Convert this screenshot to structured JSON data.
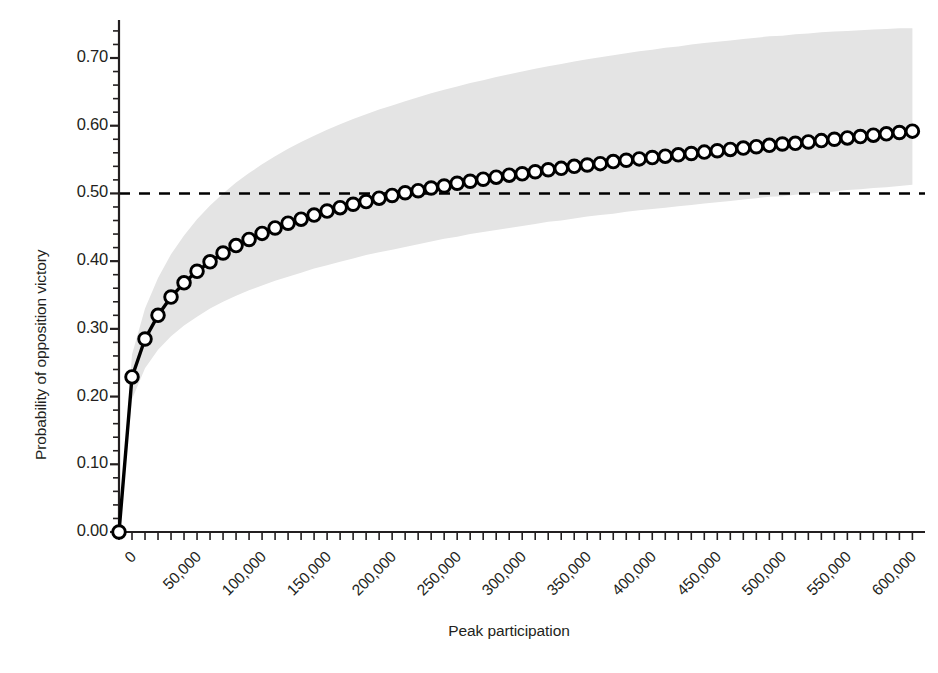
{
  "chart_data": {
    "type": "line",
    "title": "",
    "subtitle": "",
    "xlabel": "Peak participation",
    "ylabel": "Probability of opposition victory",
    "xlim": [
      0,
      612000
    ],
    "ylim": [
      0,
      0.745
    ],
    "grid": false,
    "legend_position": "none",
    "x_tick_labels": [
      "0",
      "50,000",
      "100,000",
      "150,000",
      "200,000",
      "250,000",
      "300,000",
      "350,000",
      "400,000",
      "450,000",
      "500,000",
      "550,000",
      "600,000"
    ],
    "x_tick_values": [
      0,
      50000,
      100000,
      150000,
      200000,
      250000,
      300000,
      350000,
      400000,
      450000,
      500000,
      550000,
      600000
    ],
    "x_minor_tick_step": 10000,
    "y_tick_labels": [
      "0.00",
      "0.10",
      "0.20",
      "0.30",
      "0.40",
      "0.50",
      "0.60",
      "0.70"
    ],
    "y_tick_values": [
      0.0,
      0.1,
      0.2,
      0.3,
      0.4,
      0.5,
      0.6,
      0.7
    ],
    "y_minor_tick_step": 0.02,
    "reference_line": {
      "y": 0.5,
      "style": "dashed",
      "color": "#000000",
      "label": ""
    },
    "marker": {
      "shape": "circle",
      "face_color": "#ffffff",
      "edge_color": "#000000",
      "size": 11
    },
    "line_color": "#000000",
    "band_color": "#e4e4e4",
    "band_label": "confidence interval",
    "x": [
      0,
      10000,
      20000,
      30000,
      40000,
      50000,
      60000,
      70000,
      80000,
      90000,
      100000,
      110000,
      120000,
      130000,
      140000,
      150000,
      160000,
      170000,
      180000,
      190000,
      200000,
      210000,
      220000,
      230000,
      240000,
      250000,
      260000,
      270000,
      280000,
      290000,
      300000,
      310000,
      320000,
      330000,
      340000,
      350000,
      360000,
      370000,
      380000,
      390000,
      400000,
      410000,
      420000,
      430000,
      440000,
      450000,
      460000,
      470000,
      480000,
      490000,
      500000,
      510000,
      520000,
      530000,
      540000,
      550000,
      560000,
      570000,
      580000,
      590000,
      600000,
      610000
    ],
    "y": [
      0.0,
      0.229,
      0.285,
      0.32,
      0.347,
      0.368,
      0.385,
      0.399,
      0.412,
      0.423,
      0.432,
      0.441,
      0.449,
      0.456,
      0.462,
      0.468,
      0.474,
      0.479,
      0.484,
      0.488,
      0.493,
      0.497,
      0.501,
      0.504,
      0.508,
      0.511,
      0.515,
      0.518,
      0.521,
      0.524,
      0.527,
      0.529,
      0.532,
      0.535,
      0.537,
      0.54,
      0.542,
      0.544,
      0.547,
      0.549,
      0.551,
      0.553,
      0.555,
      0.557,
      0.559,
      0.561,
      0.563,
      0.565,
      0.567,
      0.569,
      0.571,
      0.573,
      0.574,
      0.576,
      0.578,
      0.58,
      0.582,
      0.584,
      0.586,
      0.588,
      0.59,
      0.592
    ],
    "y_upper": [
      0.0,
      0.262,
      0.33,
      0.375,
      0.41,
      0.438,
      0.462,
      0.482,
      0.5,
      0.516,
      0.53,
      0.543,
      0.555,
      0.566,
      0.576,
      0.585,
      0.594,
      0.602,
      0.61,
      0.617,
      0.624,
      0.63,
      0.636,
      0.642,
      0.648,
      0.653,
      0.658,
      0.663,
      0.667,
      0.672,
      0.676,
      0.68,
      0.684,
      0.688,
      0.691,
      0.695,
      0.698,
      0.701,
      0.704,
      0.707,
      0.71,
      0.712,
      0.715,
      0.717,
      0.72,
      0.722,
      0.724,
      0.726,
      0.728,
      0.73,
      0.732,
      0.733,
      0.735,
      0.736,
      0.738,
      0.739,
      0.74,
      0.741,
      0.742,
      0.743,
      0.744,
      0.744
    ],
    "y_lower": [
      0.0,
      0.196,
      0.242,
      0.269,
      0.289,
      0.305,
      0.318,
      0.33,
      0.34,
      0.349,
      0.357,
      0.364,
      0.371,
      0.377,
      0.383,
      0.389,
      0.394,
      0.399,
      0.404,
      0.409,
      0.413,
      0.417,
      0.421,
      0.425,
      0.429,
      0.433,
      0.436,
      0.44,
      0.443,
      0.446,
      0.449,
      0.452,
      0.455,
      0.458,
      0.46,
      0.463,
      0.466,
      0.468,
      0.47,
      0.473,
      0.475,
      0.477,
      0.479,
      0.481,
      0.483,
      0.485,
      0.487,
      0.489,
      0.491,
      0.493,
      0.495,
      0.496,
      0.498,
      0.5,
      0.501,
      0.503,
      0.505,
      0.506,
      0.508,
      0.509,
      0.511,
      0.513
    ],
    "annotations": []
  }
}
